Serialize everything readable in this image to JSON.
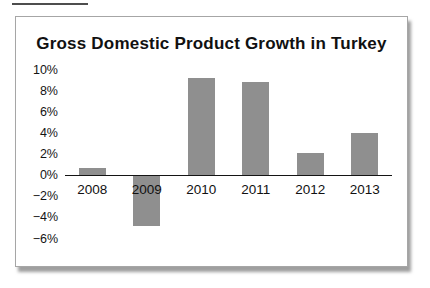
{
  "figure": {
    "caption_underline_present": true
  },
  "chart_data": {
    "type": "bar",
    "title": "Gross Domestic Product Growth in Turkey",
    "categories": [
      "2008",
      "2009",
      "2010",
      "2011",
      "2012",
      "2013"
    ],
    "values": [
      0.7,
      -4.8,
      9.2,
      8.8,
      2.1,
      4.0
    ],
    "xlabel": "",
    "ylabel": "",
    "y_ticks": [
      "10%",
      "8%",
      "6%",
      "4%",
      "2%",
      "0%",
      "−2%",
      "−4%",
      "−6%"
    ],
    "y_tick_values": [
      10,
      8,
      6,
      4,
      2,
      0,
      -2,
      -4,
      -6
    ],
    "ylim": [
      -6,
      10
    ],
    "grid": false,
    "legend": false,
    "bar_color": "#8f8f8f",
    "axis_color": "#141414",
    "text_color": "#111111",
    "frame_border_color": "#a6a6a6"
  }
}
